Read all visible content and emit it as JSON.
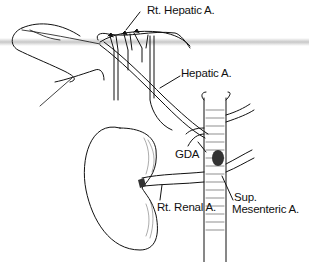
{
  "diagram": {
    "type": "anatomical-illustration",
    "labels": {
      "rt_hepatic": "Rt. Hepatic A.",
      "hepatic": "Hepatic A.",
      "gda": "GDA",
      "rt_renal": "Rt. Renal A.",
      "sup_mesenteric_line1": "Sup.",
      "sup_mesenteric_line2": "Mesenteric A."
    },
    "structures": [
      "liver-outline",
      "hepatic-artery-branches",
      "kidney",
      "aorta",
      "renal-artery",
      "superior-mesenteric-artery",
      "gastroduodenal-artery"
    ],
    "colors": {
      "ink": "#111111",
      "background": "#ffffff",
      "band": "#bebebe"
    }
  }
}
